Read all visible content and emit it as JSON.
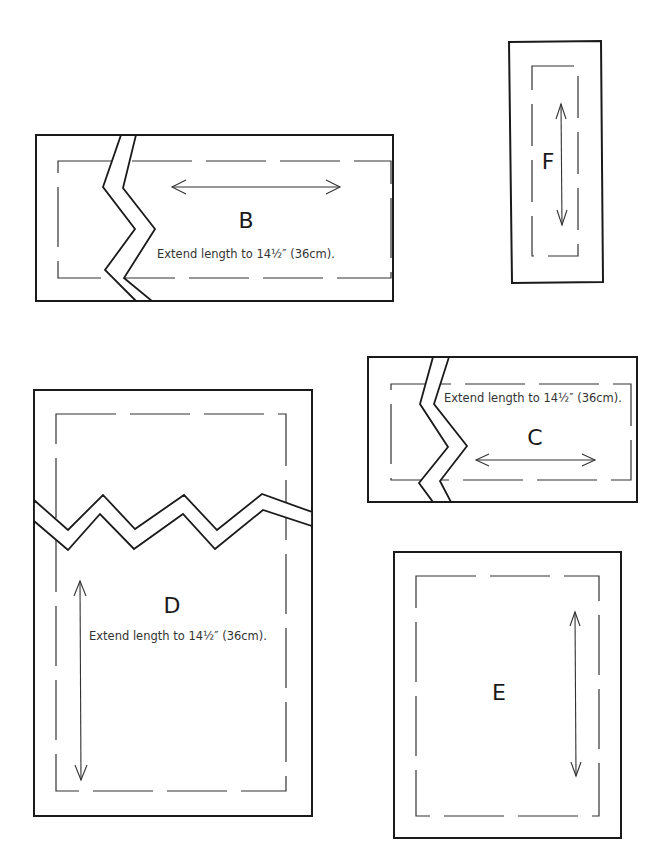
{
  "pieces": {
    "B": {
      "label": "B",
      "note": "Extend length to 14½″ (36cm).",
      "grainline": "horizontal",
      "extension_break": true
    },
    "C": {
      "label": "C",
      "note": "Extend length to 14½″ (36cm).",
      "grainline": "horizontal",
      "extension_break": true
    },
    "D": {
      "label": "D",
      "note": "Extend length to 14½″ (36cm).",
      "grainline": "vertical",
      "extension_break": true
    },
    "E": {
      "label": "E",
      "grainline": "vertical",
      "extension_break": false
    },
    "F": {
      "label": "F",
      "grainline": "vertical",
      "extension_break": false
    }
  },
  "legend": {
    "solid_line": "cutting-line",
    "dashed_line": "seam-line",
    "double_arrow": "grainline",
    "zigzag": "extension-break"
  },
  "colors": {
    "ink": "#1a1a1a",
    "paper": "#ffffff"
  }
}
